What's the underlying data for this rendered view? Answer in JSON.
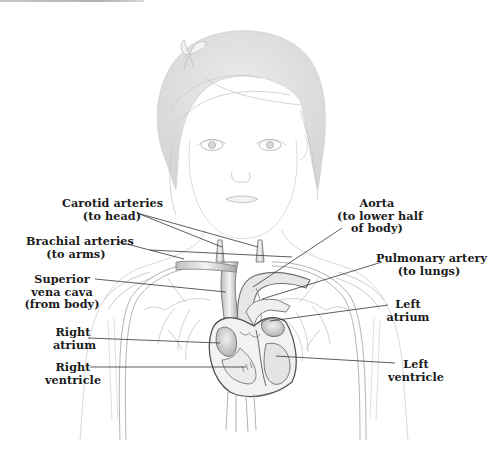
{
  "figure": {
    "colors": {
      "pencil": "#9a9a9a",
      "leader_line": "#333333",
      "label_text": "#1a1a1a",
      "background": "#ffffff"
    }
  },
  "labels": {
    "carotid": {
      "line1": "Carotid arteries",
      "line2": "(to head)"
    },
    "brachial": {
      "line1": "Brachial arteries",
      "line2": "(to arms)"
    },
    "svc": {
      "line1": "Superior",
      "line2": "vena cava",
      "line3": "(from body)"
    },
    "right_atrium": {
      "line1": "Right",
      "line2": "atrium"
    },
    "right_ventricle": {
      "line1": "Right",
      "line2": "ventricle"
    },
    "aorta": {
      "line1": "Aorta",
      "line2": "(to lower half",
      "line3": "of body)"
    },
    "pulmonary": {
      "line1": "Pulmonary artery",
      "line2": "(to lungs)"
    },
    "left_atrium": {
      "line1": "Left",
      "line2": "atrium"
    },
    "left_ventricle": {
      "line1": "Left",
      "line2": "ventricle"
    }
  }
}
